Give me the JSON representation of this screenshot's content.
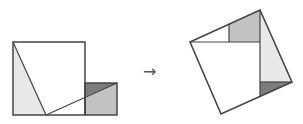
{
  "diagram": {
    "arrow_symbol": "→",
    "colors": {
      "stroke": "#444444",
      "light_gray": "#e6e6e6",
      "mid_gray": "#c0c0c0",
      "dark_gray": "#7a7a7a",
      "white": "#ffffff"
    },
    "before": {
      "large_square": {
        "x": 13,
        "y": 42,
        "size": 72
      },
      "small_square": {
        "x": 85,
        "y": 83,
        "size": 32
      },
      "cut_lines": [
        {
          "from": [
            13,
            42
          ],
          "to": [
            46,
            115
          ]
        },
        {
          "from": [
            46,
            115
          ],
          "to": [
            117,
            83
          ]
        }
      ]
    },
    "after": {
      "tilted_square": [
        [
          190,
          42
        ],
        [
          260,
          10
        ],
        [
          292,
          82
        ],
        [
          221,
          114
        ]
      ]
    }
  }
}
